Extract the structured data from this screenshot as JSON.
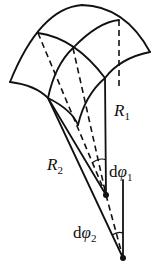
{
  "diagram": {
    "type": "curved-surface-element-radii",
    "labels": {
      "R1": {
        "main": "R",
        "sub": "1"
      },
      "R2": {
        "main": "R",
        "sub": "2"
      },
      "dphi1": {
        "d": "d",
        "phi": "φ",
        "sub": "1"
      },
      "dphi2": {
        "d": "d",
        "phi": "φ",
        "sub": "2"
      }
    },
    "colors": {
      "stroke": "#111111",
      "background": "#ffffff"
    }
  }
}
